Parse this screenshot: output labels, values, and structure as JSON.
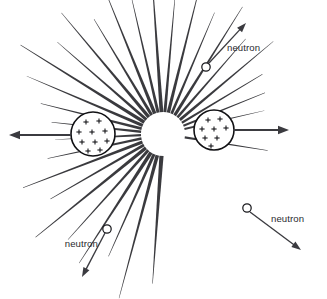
{
  "diagram": {
    "background_color": "#ffffff",
    "ray_color": "#3a3a3e",
    "outline_color": "#111114",
    "arrow_color": "#3b3b40",
    "text_color": "#2b2b2f",
    "center": {
      "x": 163,
      "y": 134
    },
    "burst": {
      "name": "energy-burst",
      "inner_radius": 22,
      "ray_count": 30,
      "rays": [
        {
          "angle": 266,
          "length": 128,
          "base_width": 4.2
        },
        {
          "angle": 255,
          "length": 148,
          "base_width": 3.6
        },
        {
          "angle": 246,
          "length": 112,
          "base_width": 3.2
        },
        {
          "angle": 237,
          "length": 132,
          "base_width": 3.8
        },
        {
          "angle": 228,
          "length": 120,
          "base_width": 3.0
        },
        {
          "angle": 219,
          "length": 142,
          "base_width": 3.4
        },
        {
          "angle": 210,
          "length": 108,
          "base_width": 2.8
        },
        {
          "angle": 201,
          "length": 128,
          "base_width": 3.2
        },
        {
          "angle": 192,
          "length": 96,
          "base_width": 2.6
        },
        {
          "angle": 183,
          "length": 86,
          "base_width": 2.4
        },
        {
          "angle": 174,
          "length": 90,
          "base_width": 2.4
        },
        {
          "angle": 166,
          "length": 104,
          "base_width": 2.8
        },
        {
          "angle": 157,
          "length": 126,
          "base_width": 3.2
        },
        {
          "angle": 148,
          "length": 146,
          "base_width": 3.6
        },
        {
          "angle": 139,
          "length": 118,
          "base_width": 3.0
        },
        {
          "angle": 130,
          "length": 136,
          "base_width": 3.4
        },
        {
          "angle": 121,
          "length": 112,
          "base_width": 3.0
        },
        {
          "angle": 112,
          "length": 132,
          "base_width": 3.6
        },
        {
          "angle": 103,
          "length": 120,
          "base_width": 3.0
        },
        {
          "angle": 94,
          "length": 140,
          "base_width": 3.8
        },
        {
          "angle": 85,
          "length": 116,
          "base_width": 3.0
        },
        {
          "angle": 76,
          "length": 134,
          "base_width": 3.4
        },
        {
          "angle": 67,
          "length": 110,
          "base_width": 2.8
        },
        {
          "angle": 58,
          "length": 128,
          "base_width": 3.2
        },
        {
          "angle": 49,
          "length": 104,
          "base_width": 2.6
        },
        {
          "angle": 40,
          "length": 122,
          "base_width": 3.0
        },
        {
          "angle": 31,
          "length": 94,
          "base_width": 2.4
        },
        {
          "angle": 22,
          "length": 88,
          "base_width": 2.4
        },
        {
          "angle": 13,
          "length": 82,
          "base_width": 2.2
        },
        {
          "angle": 351,
          "length": 84,
          "base_width": 2.2
        }
      ]
    },
    "fragments": [
      {
        "name": "left-nucleus-fragment",
        "cx": 93,
        "cy": 134,
        "r": 22,
        "charge_symbol": "+",
        "charge_count": 10,
        "charges": [
          {
            "x": 86,
            "y": 122
          },
          {
            "x": 99,
            "y": 121
          },
          {
            "x": 79,
            "y": 132
          },
          {
            "x": 92,
            "y": 132
          },
          {
            "x": 105,
            "y": 131
          },
          {
            "x": 82,
            "y": 142
          },
          {
            "x": 95,
            "y": 142
          },
          {
            "x": 107,
            "y": 141
          },
          {
            "x": 88,
            "y": 151
          },
          {
            "x": 100,
            "y": 150
          }
        ],
        "arrow": {
          "name": "left-fragment-arrow",
          "x1": 71,
          "y1": 135,
          "x2": 9,
          "y2": 135,
          "direction": "left"
        }
      },
      {
        "name": "right-nucleus-fragment",
        "cx": 214,
        "cy": 130,
        "r": 20,
        "charge_symbol": "+",
        "charge_count": 8,
        "charges": [
          {
            "x": 208,
            "y": 120
          },
          {
            "x": 220,
            "y": 119
          },
          {
            "x": 202,
            "y": 129
          },
          {
            "x": 214,
            "y": 129
          },
          {
            "x": 226,
            "y": 128
          },
          {
            "x": 205,
            "y": 138
          },
          {
            "x": 217,
            "y": 138
          },
          {
            "x": 211,
            "y": 146
          }
        ],
        "arrow": {
          "name": "right-fragment-arrow",
          "x1": 233,
          "y1": 130,
          "x2": 289,
          "y2": 130,
          "direction": "right"
        }
      }
    ],
    "neutrons": [
      {
        "name": "neutron-top-right",
        "label": "neutron",
        "circle": {
          "cx": 206,
          "cy": 67,
          "r": 4.2
        },
        "arrow": {
          "x1": 209,
          "y1": 63,
          "x2": 246,
          "y2": 23
        },
        "label_pos": {
          "x": 227,
          "y": 51
        },
        "label_anchor": "start"
      },
      {
        "name": "neutron-bottom-left",
        "label": "neutron",
        "circle": {
          "cx": 107,
          "cy": 229,
          "r": 4.2
        },
        "arrow": {
          "x1": 105,
          "y1": 233,
          "x2": 82,
          "y2": 277
        },
        "label_pos": {
          "x": 98,
          "y": 247
        },
        "label_anchor": "end"
      },
      {
        "name": "neutron-bottom-right",
        "label": "neutron",
        "circle": {
          "cx": 247,
          "cy": 208,
          "r": 4.2
        },
        "arrow": {
          "x1": 250,
          "y1": 212,
          "x2": 301,
          "y2": 250
        },
        "label_pos": {
          "x": 271,
          "y": 222
        },
        "label_anchor": "start"
      }
    ]
  },
  "chart_data": {
    "type": "diagram",
    "elements": {
      "energy_rays": 30,
      "fission_fragments": 2,
      "free_neutrons": 3
    },
    "annotations": [
      "neutron",
      "neutron",
      "neutron"
    ]
  }
}
